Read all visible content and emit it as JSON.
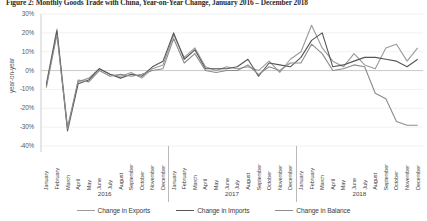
{
  "figure": {
    "title": "Figure 2: Monthly Goods Trade with China, Year-on-Year Change, January 2016 – December 2018"
  },
  "axes": {
    "ylabel": "year-on-year",
    "yticks": [
      "30%",
      "20%",
      "10%",
      "0%",
      "-10%",
      "-20%",
      "-30%",
      "-40%"
    ],
    "months": [
      "January",
      "February",
      "March",
      "April",
      "May",
      "June",
      "July",
      "August",
      "September",
      "October",
      "November",
      "December"
    ],
    "years": [
      "2016",
      "2017",
      "2018"
    ]
  },
  "legend": {
    "items": [
      {
        "label": "Change in Exports",
        "color": "#9a9a9a"
      },
      {
        "label": "Change in Imports",
        "color": "#555555"
      },
      {
        "label": "Change in Balance",
        "color": "#8c8c8c"
      }
    ]
  },
  "chart_data": {
    "type": "line",
    "title": "Figure 2: Monthly Goods Trade with China, Year-on-Year Change, January 2016 – December 2018",
    "xlabel": "",
    "ylabel": "year-on-year",
    "ylim": [
      -40,
      30
    ],
    "ytick_step": 10,
    "grid": true,
    "legend_position": "bottom",
    "x": [
      "2016-January",
      "2016-February",
      "2016-March",
      "2016-April",
      "2016-May",
      "2016-June",
      "2016-July",
      "2016-August",
      "2016-September",
      "2016-October",
      "2016-November",
      "2016-December",
      "2017-January",
      "2017-February",
      "2017-March",
      "2017-April",
      "2017-May",
      "2017-June",
      "2017-July",
      "2017-August",
      "2017-September",
      "2017-October",
      "2017-November",
      "2017-December",
      "2018-January",
      "2018-February",
      "2018-March",
      "2018-April",
      "2018-May",
      "2018-June",
      "2018-July",
      "2018-August",
      "2018-September",
      "2018-October",
      "2018-November",
      "2018-December"
    ],
    "categories": [
      "January",
      "February",
      "March",
      "April",
      "May",
      "June",
      "July",
      "August",
      "September",
      "October",
      "November",
      "December",
      "January",
      "February",
      "March",
      "April",
      "May",
      "June",
      "July",
      "August",
      "September",
      "October",
      "November",
      "December",
      "January",
      "February",
      "March",
      "April",
      "May",
      "June",
      "July",
      "August",
      "September",
      "October",
      "November",
      "December"
    ],
    "series": [
      {
        "name": "Change in Exports",
        "color": "#9a9a9a",
        "values": [
          -7,
          22,
          -30,
          -6,
          -4,
          1,
          -2,
          -3,
          -1,
          -4,
          1,
          3,
          19,
          7,
          12,
          2,
          0,
          2,
          1,
          2,
          0,
          5,
          -1,
          6,
          10,
          24,
          12,
          5,
          2,
          9,
          3,
          1,
          12,
          14,
          5,
          12
        ]
      },
      {
        "name": "Change in Imports",
        "color": "#555555",
        "values": [
          -8,
          21,
          -32,
          -7,
          -5,
          1,
          -2,
          -4,
          -2,
          -3,
          2,
          5,
          20,
          6,
          11,
          1,
          1,
          1,
          2,
          6,
          -3,
          4,
          3,
          2,
          7,
          16,
          20,
          2,
          3,
          5,
          7,
          7,
          6,
          5,
          2,
          6
        ]
      },
      {
        "name": "Change in Balance",
        "color": "#8c8c8c",
        "values": [
          -9,
          19,
          -31,
          -5,
          -6,
          0,
          -3,
          -2,
          -3,
          -2,
          0,
          1,
          17,
          4,
          9,
          0,
          -1,
          0,
          0,
          3,
          -2,
          2,
          0,
          4,
          4,
          14,
          9,
          0,
          1,
          3,
          2,
          -12,
          -15,
          -27,
          -29,
          -29
        ]
      }
    ]
  }
}
